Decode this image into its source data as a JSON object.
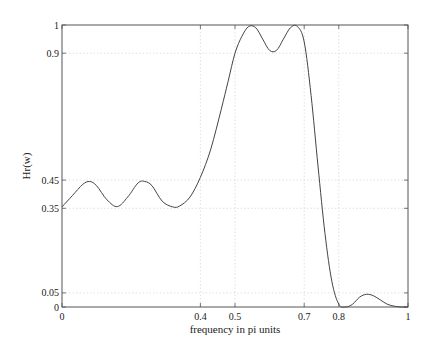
{
  "chart_data": {
    "type": "line",
    "title": "",
    "xlabel": "frequency in pi units",
    "ylabel": "Hr(w)",
    "xlim": [
      0,
      1
    ],
    "ylim": [
      0,
      1
    ],
    "grid": true,
    "xticks": [
      0,
      0.4,
      0.5,
      0.7,
      0.8,
      1
    ],
    "xtick_labels": [
      "0",
      "0.4",
      "0.5",
      "0.7",
      "0.8",
      "1"
    ],
    "yticks": [
      0,
      0.05,
      0.35,
      0.45,
      0.9,
      1
    ],
    "ytick_labels": [
      "0",
      "0.05",
      "0.35",
      "0.45",
      "0.9",
      "1"
    ],
    "series": [
      {
        "name": "Hr(w)",
        "x": [
          0,
          0.03,
          0.06,
          0.08,
          0.1,
          0.13,
          0.16,
          0.19,
          0.22,
          0.24,
          0.26,
          0.29,
          0.32,
          0.34,
          0.37,
          0.4,
          0.43,
          0.46,
          0.48,
          0.5,
          0.52,
          0.54,
          0.56,
          0.58,
          0.6,
          0.62,
          0.64,
          0.66,
          0.68,
          0.7,
          0.72,
          0.74,
          0.76,
          0.78,
          0.8,
          0.82,
          0.84,
          0.86,
          0.88,
          0.9,
          0.92,
          0.94,
          0.96,
          0.98,
          1
        ],
        "values": [
          0.355,
          0.395,
          0.435,
          0.445,
          0.43,
          0.38,
          0.356,
          0.39,
          0.44,
          0.445,
          0.43,
          0.375,
          0.355,
          0.358,
          0.39,
          0.46,
          0.56,
          0.7,
          0.8,
          0.9,
          0.96,
          0.995,
          0.99,
          0.95,
          0.91,
          0.91,
          0.95,
          0.99,
          0.995,
          0.94,
          0.75,
          0.5,
          0.26,
          0.09,
          0.01,
          0.0,
          0.01,
          0.035,
          0.045,
          0.04,
          0.025,
          0.01,
          0.003,
          0.0,
          0.0
        ]
      }
    ]
  }
}
